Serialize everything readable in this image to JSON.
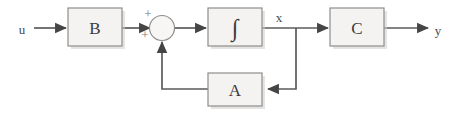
{
  "diagram": {
    "background_color": "#ffffff",
    "block_fill_color": "#f4f3f1",
    "block_stroke_color": "#8e8e8e",
    "wire_color": "#5b5b5b",
    "blocks": [
      {
        "id": "B",
        "label": "B"
      },
      {
        "id": "integrator",
        "label": "∫"
      },
      {
        "id": "C",
        "label": "C"
      },
      {
        "id": "A",
        "label": "A"
      }
    ],
    "summing_junction": {
      "label": "",
      "sign_top": "+",
      "sign_bottom": "+"
    },
    "signals": {
      "input": "u",
      "state": "x",
      "output": "y"
    }
  }
}
